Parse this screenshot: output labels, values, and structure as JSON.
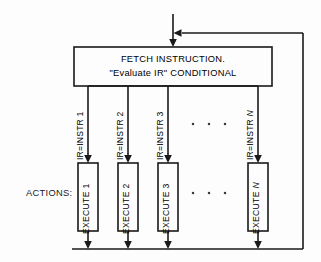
{
  "diagram": {
    "title_text_lines": [
      "FETCH INSTRUCTION.",
      "\"Evaluate IR\" CONDITIONAL"
    ],
    "actions_label": "ACTIONS:",
    "ellipsis_dots": "· · ·",
    "colors": {
      "background": "#fdfdfd",
      "stroke": "#1a1a1a",
      "box_fill": "#fdfdfd",
      "dot": "#3a3a3a"
    },
    "fetch_box": {
      "line1": "FETCH INSTRUCTION.",
      "line2": "\"Evaluate IR\" CONDITIONAL"
    },
    "branches": [
      {
        "condition_label_prefix": "IR=INSTR ",
        "condition_label_index": "1",
        "condition_italic": false,
        "execute_label_prefix": "EXECUTE ",
        "execute_label_index": "1",
        "execute_italic": false
      },
      {
        "condition_label_prefix": "IR=INSTR ",
        "condition_label_index": "2",
        "condition_italic": false,
        "execute_label_prefix": "EXECUTE ",
        "execute_label_index": "2",
        "execute_italic": false
      },
      {
        "condition_label_prefix": "IR=INSTR ",
        "condition_label_index": "3",
        "condition_italic": false,
        "execute_label_prefix": "EXECUTE ",
        "execute_label_index": "3",
        "execute_italic": false
      },
      {
        "condition_label_prefix": "IR=INSTR ",
        "condition_label_index": "N",
        "condition_italic": true,
        "execute_label_prefix": "EXECUTE ",
        "execute_label_index": "N",
        "execute_italic": true
      }
    ],
    "branch_labels": {
      "b0_cond": "IR=INSTR 1",
      "b1_cond": "IR=INSTR 2",
      "b2_cond": "IR=INSTR 3",
      "b3_cond_prefix": "IR=INSTR ",
      "b3_cond_index": "N",
      "b0_exec": "EXECUTE 1",
      "b1_exec": "EXECUTE 2",
      "b2_exec": "EXECUTE 3",
      "b3_exec_prefix": "EXECUTE ",
      "b3_exec_index": "N"
    },
    "dots_upper": "·   ·   ·",
    "dots_lower": "·   ·   ·"
  }
}
